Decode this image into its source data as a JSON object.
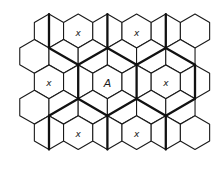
{
  "figure": {
    "colors": {
      "background": "#ffffff",
      "line": "#1a1a1a",
      "cluster_line": "#111111"
    },
    "grid": {
      "hex_orientation": "pointy-top",
      "circumradius": 16.9,
      "col_spacing": 29.2,
      "row_spacing": 25.4,
      "rows": [
        {
          "y": 31.0,
          "x0": 49.0,
          "count": 6
        },
        {
          "y": 56.4,
          "x0": 34.4,
          "count": 6
        },
        {
          "y": 81.8,
          "x0": 49.0,
          "count": 6
        },
        {
          "y": 107.2,
          "x0": 34.4,
          "count": 6
        },
        {
          "y": 132.6,
          "x0": 49.0,
          "count": 6
        }
      ]
    },
    "labels": [
      {
        "text": "x",
        "row": 0,
        "col": 1,
        "kind": "co-channel"
      },
      {
        "text": "x",
        "row": 0,
        "col": 3,
        "kind": "co-channel"
      },
      {
        "text": "x",
        "row": 2,
        "col": 0,
        "kind": "co-channel"
      },
      {
        "text": "A",
        "row": 2,
        "col": 2,
        "kind": "reference"
      },
      {
        "text": "x",
        "row": 2,
        "col": 4,
        "kind": "co-channel"
      },
      {
        "text": "x",
        "row": 4,
        "col": 1,
        "kind": "co-channel"
      },
      {
        "text": "x",
        "row": 4,
        "col": 3,
        "kind": "co-channel"
      }
    ],
    "cluster_lines": [
      [
        49.0,
        14.1,
        49.0,
        47.9
      ],
      [
        49.0,
        47.9,
        78.2,
        64.8
      ],
      [
        78.2,
        64.8,
        107.4,
        47.9
      ],
      [
        107.4,
        14.1,
        107.4,
        47.9
      ],
      [
        107.4,
        47.9,
        136.6,
        64.8
      ],
      [
        136.6,
        64.8,
        165.8,
        47.9
      ],
      [
        165.8,
        14.1,
        165.8,
        47.9
      ],
      [
        165.8,
        47.9,
        195.0,
        64.8
      ],
      [
        78.2,
        64.8,
        78.2,
        98.7
      ],
      [
        136.6,
        64.8,
        136.6,
        98.7
      ],
      [
        195.0,
        64.8,
        195.0,
        98.7
      ],
      [
        78.2,
        98.7,
        49.0,
        115.7
      ],
      [
        78.2,
        98.7,
        107.4,
        115.7
      ],
      [
        107.4,
        115.7,
        136.6,
        98.7
      ],
      [
        136.6,
        98.7,
        165.8,
        115.7
      ],
      [
        165.8,
        115.7,
        195.0,
        98.7
      ],
      [
        49.0,
        115.7,
        49.0,
        149.5
      ],
      [
        107.4,
        115.7,
        107.4,
        149.5
      ],
      [
        165.8,
        115.7,
        165.8,
        149.5
      ]
    ]
  }
}
